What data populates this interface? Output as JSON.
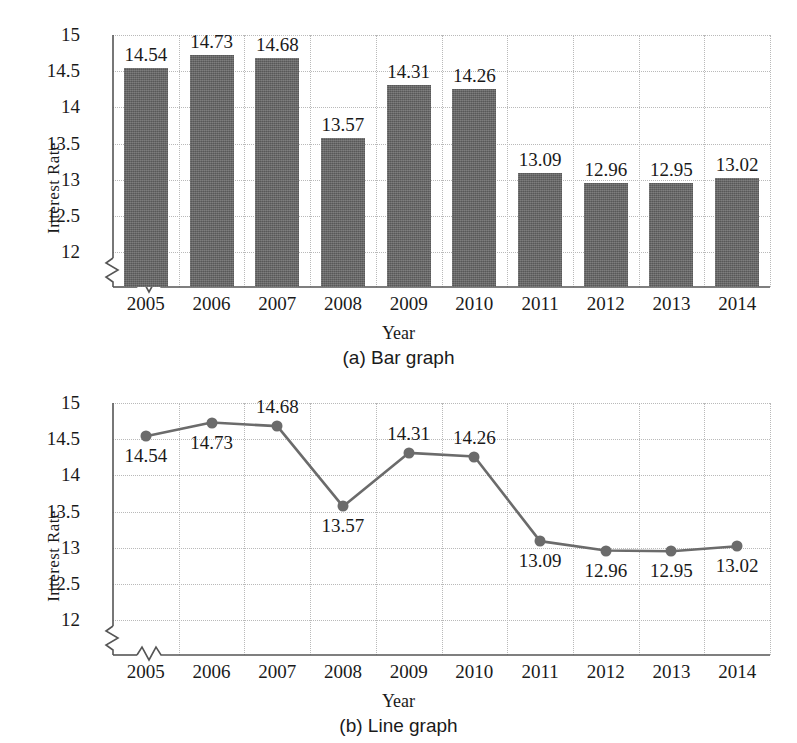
{
  "figure": {
    "ylabel": "Interest Rate",
    "xlabel": "Year",
    "caption_a": "(a) Bar graph",
    "caption_b": "(b) Line graph",
    "y_ticks": [
      "12",
      "12.5",
      "13",
      "13.5",
      "14",
      "14.5",
      "15"
    ],
    "colors": {
      "bar_fill": "#646464",
      "line_stroke": "#6b6b6b",
      "marker_fill": "#6b6b6b",
      "grid": "#b9b9b9",
      "axis": "#555555",
      "text": "#1a1a1a"
    }
  },
  "chart_data": [
    {
      "type": "bar",
      "title": "(a) Bar graph",
      "xlabel": "Year",
      "ylabel": "Interest Rate",
      "categories": [
        "2005",
        "2006",
        "2007",
        "2008",
        "2009",
        "2010",
        "2011",
        "2012",
        "2013",
        "2014"
      ],
      "values": [
        14.54,
        14.73,
        14.68,
        13.57,
        14.31,
        14.26,
        13.09,
        12.96,
        12.95,
        13.02
      ],
      "value_labels": [
        "14.54",
        "14.73",
        "14.68",
        "13.57",
        "14.31",
        "14.26",
        "13.09",
        "12.96",
        "12.95",
        "13.02"
      ],
      "ylim": [
        11.75,
        15.0
      ],
      "yticks": [
        12,
        12.5,
        13,
        13.5,
        14,
        14.5,
        15
      ],
      "ytick_labels": [
        "12",
        "12.5",
        "13",
        "13.5",
        "14",
        "14.5",
        "15"
      ],
      "grid": true,
      "axis_break_y": true,
      "axis_break_x": true,
      "legend": null
    },
    {
      "type": "line",
      "title": "(b) Line graph",
      "xlabel": "Year",
      "ylabel": "Interest Rate",
      "categories": [
        "2005",
        "2006",
        "2007",
        "2008",
        "2009",
        "2010",
        "2011",
        "2012",
        "2013",
        "2014"
      ],
      "values": [
        14.54,
        14.73,
        14.68,
        13.57,
        14.31,
        14.26,
        13.09,
        12.96,
        12.95,
        13.02
      ],
      "value_labels": [
        "14.54",
        "14.73",
        "14.68",
        "13.57",
        "14.31",
        "14.26",
        "13.09",
        "12.96",
        "12.95",
        "13.02"
      ],
      "label_positions": [
        "below",
        "below",
        "above",
        "below",
        "above",
        "above",
        "below",
        "below",
        "below",
        "below"
      ],
      "ylim": [
        11.75,
        15.0
      ],
      "yticks": [
        12,
        12.5,
        13,
        13.5,
        14,
        14.5,
        15
      ],
      "ytick_labels": [
        "12",
        "12.5",
        "13",
        "13.5",
        "14",
        "14.5",
        "15"
      ],
      "grid": true,
      "markers": true,
      "axis_break_y": true,
      "axis_break_x": true,
      "legend": null
    }
  ]
}
